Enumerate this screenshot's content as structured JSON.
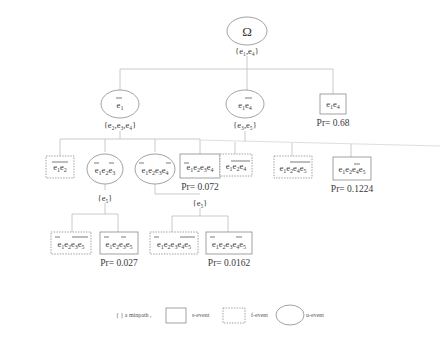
{
  "diagram": {
    "root": {
      "label": "Ω",
      "minpath": "{e₁,e₄}"
    },
    "level1": [
      {
        "id": "n_e1bar",
        "type": "u-event",
        "label": "ē₁",
        "minpath": "{e₂,e₃,e₄}"
      },
      {
        "id": "n_e1e4bar",
        "type": "u-event",
        "label": "e₁ē₄",
        "minpath": "{e₃,e₅}"
      },
      {
        "id": "n_e1e4",
        "type": "s-event",
        "label": "e₁e₄",
        "pr": "Pr= 0.68"
      }
    ],
    "level2": [
      {
        "id": "n_e1e2",
        "type": "f-event",
        "label": "ē₁ē₂",
        "parent": "n_e1bar"
      },
      {
        "id": "n_e1e2e3",
        "type": "u-event",
        "label": "ē₁e₂ē₃",
        "minpath": "{e₅}",
        "parent": "n_e1bar"
      },
      {
        "id": "n_e1e2e3e4u",
        "type": "u-event",
        "label": "ē₁e₂e₃ē₄",
        "parent": "n_e1bar",
        "minpath": "{e₅}"
      },
      {
        "id": "n_e1e2e3e4s",
        "type": "s-event",
        "label": "ē₁e₂e₃e₄",
        "pr": "Pr= 0.072",
        "parent": "n_e1bar"
      },
      {
        "id": "n_e1e2e4",
        "type": "f-event",
        "label": "e₁ē₂ē₄ (overline over e₂e₄)",
        "display": "e₁e₂e₄",
        "parent": "n_e1e4bar"
      },
      {
        "id": "n_e1e2e4e5",
        "type": "f-event",
        "display": "e₁e₂e₄e₅",
        "parent": "n_e1e4bar"
      },
      {
        "id": "n_e1e2e4e5b",
        "type": "s-event",
        "display": "e₁e₂e₄e₅",
        "pr": "Pr= 0.1224",
        "parent": "n_e1e4bar"
      }
    ],
    "level3": [
      {
        "id": "n_a",
        "type": "f-event",
        "display": "e₁e₂e₃e₅",
        "parent": "n_e1e2e3"
      },
      {
        "id": "n_b",
        "type": "s-event",
        "display": "e₁e₂e₃e₅",
        "pr": "Pr= 0.027",
        "parent": "n_e1e2e3"
      },
      {
        "id": "n_c",
        "type": "f-event",
        "display": "e₁e₂e₃e₄e₅",
        "parent": "n_e1e2e3e4u"
      },
      {
        "id": "n_d",
        "type": "s-event",
        "display": "e₁e₂e₃e₄e₅",
        "pr": "Pr= 0.0162",
        "parent": "n_e1e2e3e4u"
      }
    ],
    "legend": {
      "minpath": "{ }  a minpath ,",
      "s_event": "s-event",
      "f_event": "f-event",
      "u_event": "u-event"
    }
  }
}
